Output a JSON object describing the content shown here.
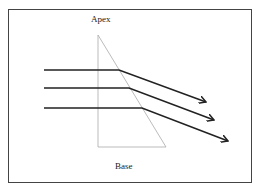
{
  "labels": {
    "apex": "Apex",
    "base": "Base"
  },
  "colors": {
    "prism": "#aaaaaa",
    "rays": "#222222",
    "frame": "#444444"
  },
  "prism": {
    "apex": [
      98,
      35
    ],
    "base_left": [
      98,
      147
    ],
    "base_right": [
      166,
      147
    ]
  },
  "rays": [
    {
      "start": [
        44,
        70
      ],
      "bend": [
        119,
        70
      ],
      "end": [
        206,
        102
      ]
    },
    {
      "start": [
        44,
        88
      ],
      "bend": [
        129,
        88
      ],
      "end": [
        214,
        120
      ]
    },
    {
      "start": [
        44,
        108
      ],
      "bend": [
        142,
        108
      ],
      "end": [
        228,
        141
      ]
    }
  ]
}
